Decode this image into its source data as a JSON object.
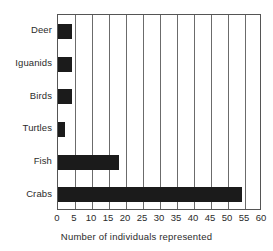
{
  "chart_data": {
    "type": "bar",
    "orientation": "horizontal",
    "title": "",
    "xlabel": "Number of individuals represented",
    "ylabel": "",
    "categories": [
      "Deer",
      "Iguanids",
      "Birds",
      "Turtles",
      "Fish",
      "Crabs"
    ],
    "values": [
      4,
      4,
      4,
      2,
      18,
      54
    ],
    "xlim": [
      0,
      60
    ],
    "xticks": [
      0,
      5,
      10,
      15,
      20,
      25,
      30,
      35,
      40,
      45,
      50,
      55,
      60
    ],
    "xtick_labels": [
      "0",
      "5",
      "10",
      "15",
      "20",
      "25",
      "30",
      "35",
      "40",
      "45",
      "50",
      "55",
      "60"
    ],
    "grid": true,
    "grid_axis": "x",
    "legend": false,
    "bar_color": "#1b1b1b",
    "frame_color": "#555555",
    "grid_color": "#6b6b6b"
  }
}
